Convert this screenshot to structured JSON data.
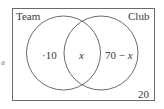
{
  "diagram": {
    "type": "venn",
    "universe": {
      "outside_value": "20"
    },
    "sets": [
      {
        "name": "Team",
        "label": "Team"
      },
      {
        "name": "Club",
        "label": "Club"
      }
    ],
    "regions": {
      "team_only": "40",
      "team_only_display": "·10",
      "both": "x",
      "club_only_prefix": "70 − ",
      "club_only_var": "x",
      "outside": "20"
    },
    "edge_fragment": "a",
    "colors": {
      "stroke": "#6b6b6b",
      "text": "#3a3a3a",
      "background": "#ffffff"
    }
  }
}
